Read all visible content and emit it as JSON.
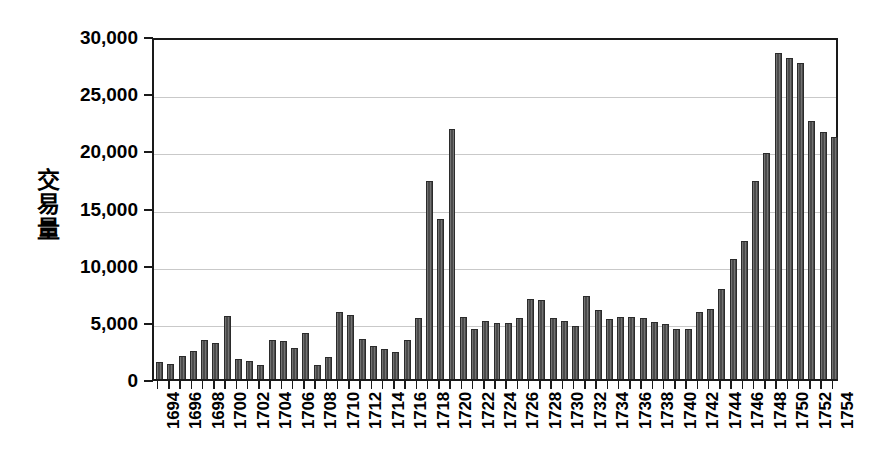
{
  "chart_data": {
    "type": "bar",
    "title": "",
    "subtitle": "",
    "xlabel": "",
    "ylabel": "交易量",
    "ylabel_chars": [
      "交",
      "易",
      "量"
    ],
    "ylim": [
      0,
      30000
    ],
    "ytick_values": [
      0,
      5000,
      10000,
      15000,
      20000,
      25000,
      30000
    ],
    "ytick_labels": [
      "0",
      "5,000",
      "10,000",
      "15,000",
      "20,000",
      "25,000",
      "30,000"
    ],
    "grid": true,
    "grid_axis": "y",
    "legend": false,
    "legend_position": "none",
    "bar_color": "#4b4b4b",
    "bar_edge_color": "#2b2b2b",
    "xtick_label_rotation": 90,
    "xtick_label_step": 2,
    "xtick_labels": [
      "1694",
      "1696",
      "1698",
      "1700",
      "1702",
      "1704",
      "1706",
      "1708",
      "1710",
      "1712",
      "1714",
      "1716",
      "1718",
      "1720",
      "1722",
      "1724",
      "1726",
      "1728",
      "1730",
      "1732",
      "1734",
      "1736",
      "1738",
      "1740",
      "1742",
      "1744",
      "1746",
      "1748",
      "1750",
      "1752",
      "1754"
    ],
    "categories": [
      "1694",
      "1695",
      "1696",
      "1697",
      "1698",
      "1699",
      "1700",
      "1701",
      "1702",
      "1703",
      "1704",
      "1705",
      "1706",
      "1707",
      "1708",
      "1709",
      "1710",
      "1711",
      "1712",
      "1713",
      "1714",
      "1715",
      "1716",
      "1717",
      "1718",
      "1719",
      "1720",
      "1721",
      "1722",
      "1723",
      "1724",
      "1725",
      "1726",
      "1727",
      "1728",
      "1729",
      "1730",
      "1731",
      "1732",
      "1733",
      "1734",
      "1735",
      "1736",
      "1737",
      "1738",
      "1739",
      "1740",
      "1741",
      "1742",
      "1743",
      "1744",
      "1745",
      "1746",
      "1747",
      "1748",
      "1749",
      "1750",
      "1751",
      "1752",
      "1753",
      "1754"
    ],
    "values": [
      1450,
      1350,
      2000,
      2450,
      3400,
      3150,
      5550,
      1750,
      1550,
      1250,
      3400,
      3350,
      2750,
      4000,
      1250,
      1900,
      5900,
      5600,
      3500,
      2900,
      2650,
      2350,
      3400,
      5350,
      17300,
      14000,
      21900,
      5400,
      4350,
      5100,
      4900,
      4900,
      5300,
      7000,
      6950,
      5350,
      5050,
      4650,
      7250,
      6050,
      5250,
      5450,
      5450,
      5300,
      4950,
      4800,
      4350,
      4350,
      5900,
      6150,
      7900,
      10500,
      12100,
      17300,
      19800,
      28500,
      28100,
      27600,
      22600,
      21600,
      21200
    ]
  }
}
